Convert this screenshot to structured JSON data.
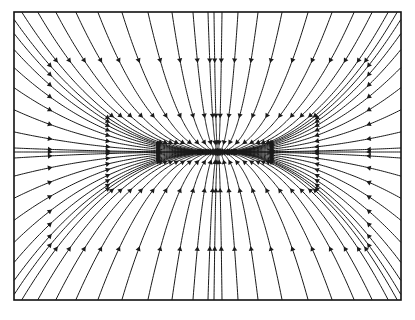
{
  "figure": {
    "caption": "",
    "background_color": "#ffffff",
    "line_color": "#1a1a1a",
    "frame_color": "#111111"
  },
  "chart_data": {
    "type": "line",
    "subtitle": "",
    "xlabel": "",
    "ylabel": "",
    "xlim": [
      -1,
      1
    ],
    "ylim": [
      -1,
      1
    ],
    "xticks": [],
    "yticks": [],
    "tick_labels": [],
    "legend": [],
    "legend_position": "none",
    "grid": false,
    "annotations": [],
    "frame": {
      "x": 14,
      "y": 12,
      "width": 387,
      "height": 288,
      "stroke_width": 1.6
    },
    "field": {
      "kind": "stable-node",
      "description": "All streamlines converge inward onto a single critical point",
      "critical_point": {
        "x": 218,
        "y": 152,
        "label": ""
      },
      "flow_direction": "inward",
      "separatrix_vertical_x": 216,
      "separatrix_horizontal_y": 154,
      "exponent_x": 1.0,
      "exponent_y": 2.2,
      "arrow_count_per_line": 4,
      "line_width": 1.0,
      "arrow_size": 4.2
    },
    "seeds": {
      "top_edge_x": [
        22,
        38,
        56,
        76,
        98,
        122,
        148,
        172,
        193,
        208,
        214,
        222,
        238,
        258,
        282,
        308,
        332,
        354,
        372,
        388,
        397
      ],
      "bottom_edge_x": [
        22,
        38,
        56,
        76,
        98,
        122,
        148,
        172,
        193,
        208,
        214,
        222,
        238,
        258,
        282,
        308,
        332,
        354,
        372,
        388,
        397
      ],
      "left_edge_y": [
        20,
        34,
        50,
        68,
        88,
        110,
        132,
        148,
        152,
        158,
        176,
        198,
        220,
        242,
        262,
        280,
        294
      ],
      "right_edge_y": [
        20,
        34,
        50,
        68,
        88,
        110,
        132,
        148,
        152,
        158,
        176,
        198,
        220,
        242,
        262,
        280,
        294
      ]
    },
    "series": [
      {
        "name": "streamlines",
        "values": []
      }
    ]
  }
}
